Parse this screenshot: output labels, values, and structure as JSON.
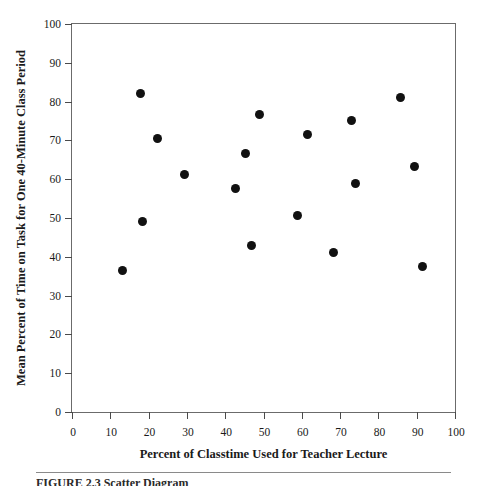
{
  "chart_data": {
    "type": "scatter",
    "title": "",
    "xlabel": "Percent of Classtime Used for Teacher Lecture",
    "ylabel": "Mean Percent of Time on Task for One 40-Minute Class Period",
    "xlim": [
      0,
      100
    ],
    "ylim": [
      0,
      100
    ],
    "grid": false,
    "legend": null,
    "xticks": [
      0,
      10,
      20,
      30,
      40,
      50,
      60,
      70,
      80,
      90,
      100
    ],
    "yticks": [
      0,
      10,
      20,
      30,
      40,
      50,
      60,
      70,
      80,
      90,
      100
    ],
    "xtick_labels": [
      "0",
      "10",
      "20",
      "30",
      "40",
      "50",
      "60",
      "70",
      "80",
      "90",
      "100"
    ],
    "ytick_labels": [
      "0",
      "10",
      "20",
      "30",
      "40",
      "50",
      "60",
      "70",
      "80",
      "90",
      "100"
    ],
    "marker": "filled-circle",
    "marker_color": "#111111",
    "marker_size_px": 9,
    "n_points": 17,
    "points": [
      {
        "x": 13.1,
        "y": 36.5
      },
      {
        "x": 18.0,
        "y": 82.2
      },
      {
        "x": 18.3,
        "y": 49.2
      },
      {
        "x": 22.2,
        "y": 70.4
      },
      {
        "x": 29.5,
        "y": 61.2
      },
      {
        "x": 42.7,
        "y": 57.6
      },
      {
        "x": 45.3,
        "y": 66.5
      },
      {
        "x": 46.9,
        "y": 42.8
      },
      {
        "x": 49.0,
        "y": 76.6
      },
      {
        "x": 58.8,
        "y": 50.7
      },
      {
        "x": 61.4,
        "y": 71.5
      },
      {
        "x": 68.2,
        "y": 41.0
      },
      {
        "x": 72.9,
        "y": 75.1
      },
      {
        "x": 74.0,
        "y": 59.0
      },
      {
        "x": 85.8,
        "y": 81.0
      },
      {
        "x": 89.5,
        "y": 63.4
      },
      {
        "x": 91.6,
        "y": 37.5
      }
    ]
  },
  "figure": {
    "caption": "FIGURE 2.3   Scatter Diagram"
  },
  "colors": {
    "frame": "#6b6b6b",
    "tick": "#4a4a4a",
    "marker": "#111111",
    "text": "#1a1a1a",
    "rule": "#8a8a8a"
  }
}
